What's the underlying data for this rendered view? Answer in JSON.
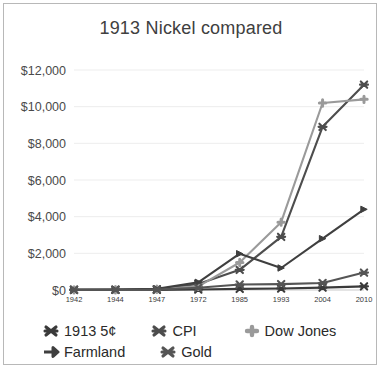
{
  "chart_data": {
    "type": "line",
    "title": "1913 Nickel compared",
    "xlabel": "",
    "ylabel": "",
    "categories": [
      "1942",
      "1944",
      "1947",
      "1972",
      "1985",
      "1993",
      "2004",
      "2010"
    ],
    "ylim": [
      0,
      12000
    ],
    "yticks": [
      0,
      2000,
      4000,
      6000,
      8000,
      10000,
      12000
    ],
    "ytick_labels": [
      "$0",
      "$2,000",
      "$4,000",
      "$6,000",
      "$8,000",
      "$10,000",
      "$12,000"
    ],
    "grid": true,
    "legend_position": "bottom",
    "series": [
      {
        "name": "1913 5¢",
        "color": "#3a3a3a",
        "marker": "star",
        "values": [
          5,
          5,
          8,
          25,
          60,
          80,
          130,
          200
        ]
      },
      {
        "name": "CPI",
        "color": "#4d4d4d",
        "marker": "star",
        "values": [
          10,
          15,
          40,
          330,
          1100,
          2900,
          8900,
          11200
        ]
      },
      {
        "name": "Dow Jones",
        "color": "#9a9a9a",
        "marker": "plus",
        "values": [
          8,
          12,
          45,
          200,
          1500,
          3700,
          10200,
          10400
        ]
      },
      {
        "name": "Farmland",
        "color": "#3f3f3f",
        "marker": "arrow",
        "values": [
          12,
          20,
          60,
          420,
          1980,
          1200,
          2800,
          4400
        ]
      },
      {
        "name": "Gold",
        "color": "#555555",
        "marker": "star",
        "values": [
          10,
          12,
          30,
          120,
          300,
          320,
          380,
          950
        ]
      }
    ]
  },
  "legend": {
    "row1": [
      "1913 5¢",
      "CPI",
      "Dow Jones"
    ],
    "row2": [
      "Farmland",
      "Gold"
    ]
  }
}
